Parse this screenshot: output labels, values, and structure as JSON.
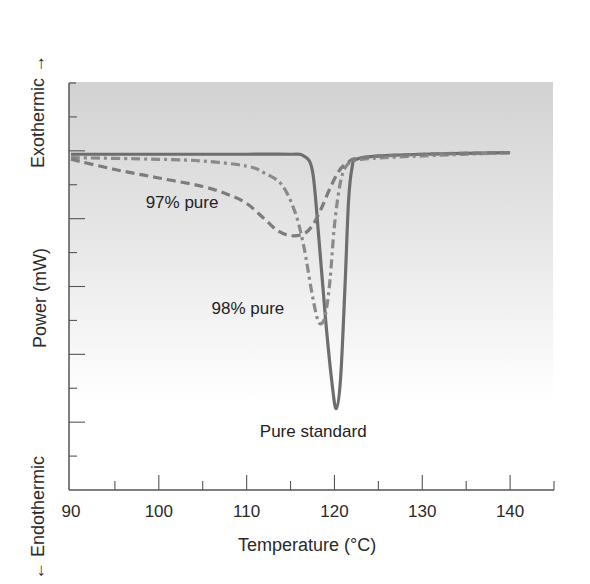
{
  "chart_data": {
    "type": "line",
    "title": "",
    "xlabel": "Temperature (°C)",
    "ylabel": "Power (mW)",
    "y_direction_labels": {
      "top": "Exothermic",
      "bottom": "Endothermic"
    },
    "xlim": [
      90,
      145
    ],
    "ylim": [
      0,
      12
    ],
    "x_ticks_major": [
      90,
      100,
      110,
      120,
      130,
      140
    ],
    "x_ticks_minor": [
      95,
      105,
      115,
      125,
      135,
      145
    ],
    "y_tick_labels": [],
    "grid": false,
    "legend": "none (inline annotations)",
    "background": {
      "gradient_top": "#d2d2d2",
      "gradient_bottom": "#ffffff"
    },
    "series": [
      {
        "name": "Pure standard",
        "style": "solid",
        "color": "#6e6e6e",
        "x": [
          90,
          100,
          110,
          115,
          116.5,
          117.5,
          118.2,
          119,
          119.7,
          120.2,
          120.7,
          121.2,
          121.6,
          122,
          122.5,
          125,
          130,
          140
        ],
        "y": [
          9.9,
          9.9,
          9.9,
          9.9,
          9.85,
          9.4,
          7.5,
          5.0,
          3.2,
          2.4,
          3.3,
          6.0,
          8.5,
          9.5,
          9.75,
          9.85,
          9.9,
          9.95
        ]
      },
      {
        "name": "98% pure",
        "style": "dash-dot",
        "color": "#8a8a8a",
        "x": [
          90,
          100,
          105,
          110,
          112,
          114,
          115.5,
          116.5,
          117.3,
          118,
          118.5,
          119,
          119.5,
          120,
          120.7,
          121.5,
          123,
          130,
          140
        ],
        "y": [
          9.8,
          9.75,
          9.7,
          9.55,
          9.35,
          9.0,
          8.2,
          7.2,
          6.0,
          5.1,
          4.9,
          5.2,
          6.2,
          7.8,
          9.1,
          9.6,
          9.75,
          9.85,
          9.95
        ]
      },
      {
        "name": "97% pure",
        "style": "dashed",
        "color": "#7c7c7c",
        "x": [
          90,
          95,
          100,
          105,
          108,
          110,
          112,
          113.5,
          115,
          116.5,
          117.5,
          118.5,
          119.5,
          120.5,
          121.5,
          123,
          130,
          140
        ],
        "y": [
          9.75,
          9.45,
          9.2,
          8.95,
          8.7,
          8.45,
          8.0,
          7.65,
          7.5,
          7.55,
          7.8,
          8.3,
          8.9,
          9.4,
          9.65,
          9.8,
          9.9,
          9.95
        ]
      }
    ],
    "annotations": [
      {
        "text": "97% pure",
        "x": 98.5,
        "y": 8.3
      },
      {
        "text": "98% pure",
        "x": 106,
        "y": 5.2
      },
      {
        "text": "Pure standard",
        "x": 111.5,
        "y": 1.55
      }
    ]
  },
  "axis": {
    "x_label": "Temperature (°C)",
    "y_label": "Power (mW)",
    "exo_label": "Exothermic",
    "endo_label": "Endothermic",
    "x_tick_labels": [
      "90",
      "100",
      "110",
      "120",
      "130",
      "140"
    ]
  }
}
